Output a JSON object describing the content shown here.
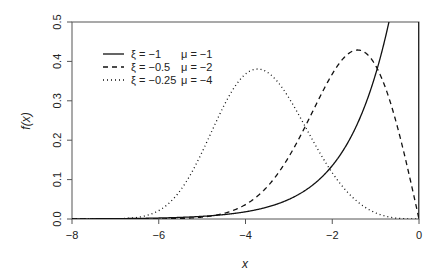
{
  "chart_data": {
    "type": "line",
    "title": "",
    "xlabel": "x",
    "ylabel": "f(x)",
    "xlim": [
      -8,
      0
    ],
    "ylim": [
      0,
      0.5
    ],
    "xticks": [
      "-8",
      "-6",
      "-4",
      "-2",
      "0"
    ],
    "yticks": [
      "0.0",
      "0.1",
      "0.2",
      "0.3",
      "0.4",
      "0.5"
    ],
    "grid": false,
    "legend_position": "top-left",
    "series": [
      {
        "name": "ξ = -1   μ = -1",
        "xi": -1,
        "mu": -1,
        "style": "solid",
        "xi_label": "ξ = −1",
        "mu_label": "μ = −1",
        "peak": {
          "x": 0,
          "y": 1.0
        }
      },
      {
        "name": "ξ = -0.5   μ = -2",
        "xi": -0.5,
        "mu": -2,
        "style": "dashed",
        "xi_label": "ξ = −0.5",
        "mu_label": "μ = −2",
        "peak": {
          "x": -1.45,
          "y": 0.43
        }
      },
      {
        "name": "ξ = -0.25   μ = -4",
        "xi": -0.25,
        "mu": -4,
        "style": "dotted",
        "xi_label": "ξ = −0.25",
        "mu_label": "μ = −4",
        "peak": {
          "x": -3.7,
          "y": 0.38
        }
      }
    ]
  }
}
